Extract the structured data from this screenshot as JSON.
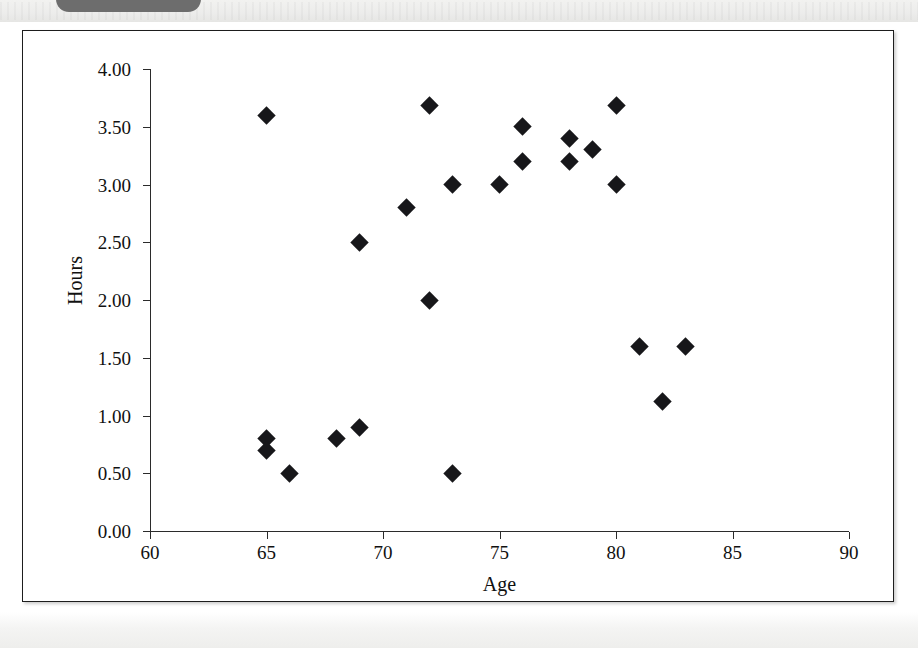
{
  "page": {
    "tab_label": "",
    "background_color": "#ffffff",
    "frame_border_color": "#1d1d1d"
  },
  "chart_data": {
    "type": "scatter",
    "title": "",
    "xlabel": "Age",
    "ylabel": "Hours",
    "xlim": [
      60,
      90
    ],
    "ylim": [
      0,
      4
    ],
    "xticks": [
      60,
      65,
      70,
      75,
      80,
      85,
      90
    ],
    "xtick_labels": [
      "60",
      "65",
      "70",
      "75",
      "80",
      "85",
      "90"
    ],
    "yticks": [
      0,
      0.5,
      1,
      1.5,
      2,
      2.5,
      3,
      3.5,
      4
    ],
    "ytick_labels": [
      "0.00",
      "0.50",
      "1.00",
      "1.50",
      "2.00",
      "2.50",
      "3.00",
      "3.50",
      "4.00"
    ],
    "grid": false,
    "legend": false,
    "marker_shape": "diamond",
    "marker_color": "#17171a",
    "x": [
      65,
      65,
      65,
      66,
      68,
      69,
      69,
      71,
      72,
      72,
      73,
      73,
      75,
      76,
      76,
      78,
      78,
      79,
      80,
      80,
      81,
      82,
      83
    ],
    "y": [
      3.6,
      0.8,
      0.7,
      0.5,
      0.8,
      0.9,
      2.5,
      2.8,
      3.68,
      2.0,
      3.0,
      0.5,
      3.0,
      3.5,
      3.2,
      3.4,
      3.2,
      3.3,
      3.68,
      3.0,
      1.6,
      1.12,
      1.6
    ],
    "points": [
      {
        "age": 65,
        "hours": 3.6
      },
      {
        "age": 65,
        "hours": 0.8
      },
      {
        "age": 65,
        "hours": 0.7
      },
      {
        "age": 66,
        "hours": 0.5
      },
      {
        "age": 68,
        "hours": 0.8
      },
      {
        "age": 69,
        "hours": 0.9
      },
      {
        "age": 69,
        "hours": 2.5
      },
      {
        "age": 71,
        "hours": 2.8
      },
      {
        "age": 72,
        "hours": 3.68
      },
      {
        "age": 72,
        "hours": 2.0
      },
      {
        "age": 73,
        "hours": 3.0
      },
      {
        "age": 73,
        "hours": 0.5
      },
      {
        "age": 75,
        "hours": 3.0
      },
      {
        "age": 76,
        "hours": 3.5
      },
      {
        "age": 76,
        "hours": 3.2
      },
      {
        "age": 78,
        "hours": 3.4
      },
      {
        "age": 78,
        "hours": 3.2
      },
      {
        "age": 79,
        "hours": 3.3
      },
      {
        "age": 80,
        "hours": 3.68
      },
      {
        "age": 80,
        "hours": 3.0
      },
      {
        "age": 81,
        "hours": 1.6
      },
      {
        "age": 82,
        "hours": 1.12
      },
      {
        "age": 83,
        "hours": 1.6
      }
    ]
  }
}
